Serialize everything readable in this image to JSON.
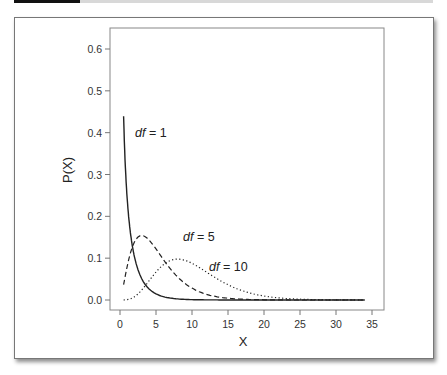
{
  "chart_data": {
    "type": "line",
    "title": "",
    "xlabel": "X",
    "ylabel": "P(X)",
    "xlim": [
      0,
      35
    ],
    "ylim": [
      0,
      0.63
    ],
    "xticks": [
      0,
      5,
      10,
      15,
      20,
      25,
      30,
      35
    ],
    "xtick_labels": [
      "0",
      "5",
      "10",
      "15",
      "20",
      "25",
      "30",
      "35"
    ],
    "yticks": [
      0.0,
      0.1,
      0.2,
      0.3,
      0.4,
      0.5,
      0.6
    ],
    "ytick_labels": [
      "0.0",
      "0.1",
      "0.2",
      "0.3",
      "0.4",
      "0.5",
      "0.6"
    ],
    "grid": false,
    "legend": "none (inline annotations)",
    "series": [
      {
        "name": "df = 1",
        "style": "solid",
        "x": [
          0.5,
          1,
          1.5,
          2,
          3,
          4,
          5,
          6,
          8,
          10,
          15,
          20,
          25,
          30,
          34
        ],
        "values": [
          0.627,
          0.242,
          0.139,
          0.104,
          0.051,
          0.027,
          0.015,
          0.008,
          0.003,
          0.001,
          0.0,
          0.0,
          0.0,
          0.0,
          0.0
        ]
      },
      {
        "name": "df = 5",
        "style": "dashed",
        "x": [
          0.5,
          1,
          2,
          3,
          4,
          5,
          6,
          8,
          10,
          12,
          15,
          20,
          25,
          30,
          34
        ],
        "values": [
          0.037,
          0.081,
          0.138,
          0.154,
          0.144,
          0.122,
          0.097,
          0.055,
          0.028,
          0.013,
          0.004,
          0.0,
          0.0,
          0.0,
          0.0
        ]
      },
      {
        "name": "df = 10",
        "style": "dotted",
        "x": [
          0.5,
          1,
          2,
          4,
          6,
          8,
          10,
          12,
          14,
          16,
          18,
          20,
          25,
          30,
          34
        ],
        "values": [
          0.0,
          0.001,
          0.008,
          0.045,
          0.084,
          0.098,
          0.088,
          0.066,
          0.045,
          0.028,
          0.016,
          0.009,
          0.002,
          0.0,
          0.0
        ]
      }
    ],
    "annotations": [
      {
        "text": "df = 1",
        "x": 2.5,
        "y": 0.4
      },
      {
        "text": "df = 5",
        "x": 6.8,
        "y": 0.13
      },
      {
        "text": "df = 10",
        "x": 14,
        "y": 0.09
      }
    ]
  },
  "labels": {
    "xlabel": "X",
    "ylabel": "P(X)",
    "annot_df1_italic": "df",
    "annot_df1_rest": " = 1",
    "annot_df5_italic": "df",
    "annot_df5_rest": " = 5",
    "annot_df10_italic": "df",
    "annot_df10_rest": " = 10"
  }
}
